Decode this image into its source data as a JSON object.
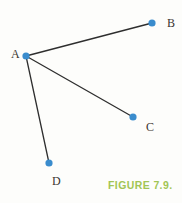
{
  "figure": {
    "caption": "FIGURE 7.9.",
    "caption_color": "#a2c554"
  },
  "diagram": {
    "type": "graph",
    "background_color": "#fdfdfb",
    "node_color": "#3a8ccd",
    "node_radius": 3.6,
    "edge_color": "#2e2e2e",
    "edge_width": 1.3,
    "label_color": "#3b3530",
    "nodes": [
      {
        "id": "A",
        "label": "A",
        "x": 26,
        "y": 56,
        "label_x": 11,
        "label_y": 58
      },
      {
        "id": "B",
        "label": "B",
        "x": 152,
        "y": 23,
        "label_x": 167,
        "label_y": 27
      },
      {
        "id": "C",
        "label": "C",
        "x": 133,
        "y": 117,
        "label_x": 146,
        "label_y": 131
      },
      {
        "id": "D",
        "label": "D",
        "x": 49,
        "y": 163,
        "label_x": 52,
        "label_y": 185
      }
    ],
    "edges": [
      {
        "from": "A",
        "to": "B"
      },
      {
        "from": "A",
        "to": "C"
      },
      {
        "from": "A",
        "to": "D"
      }
    ]
  }
}
